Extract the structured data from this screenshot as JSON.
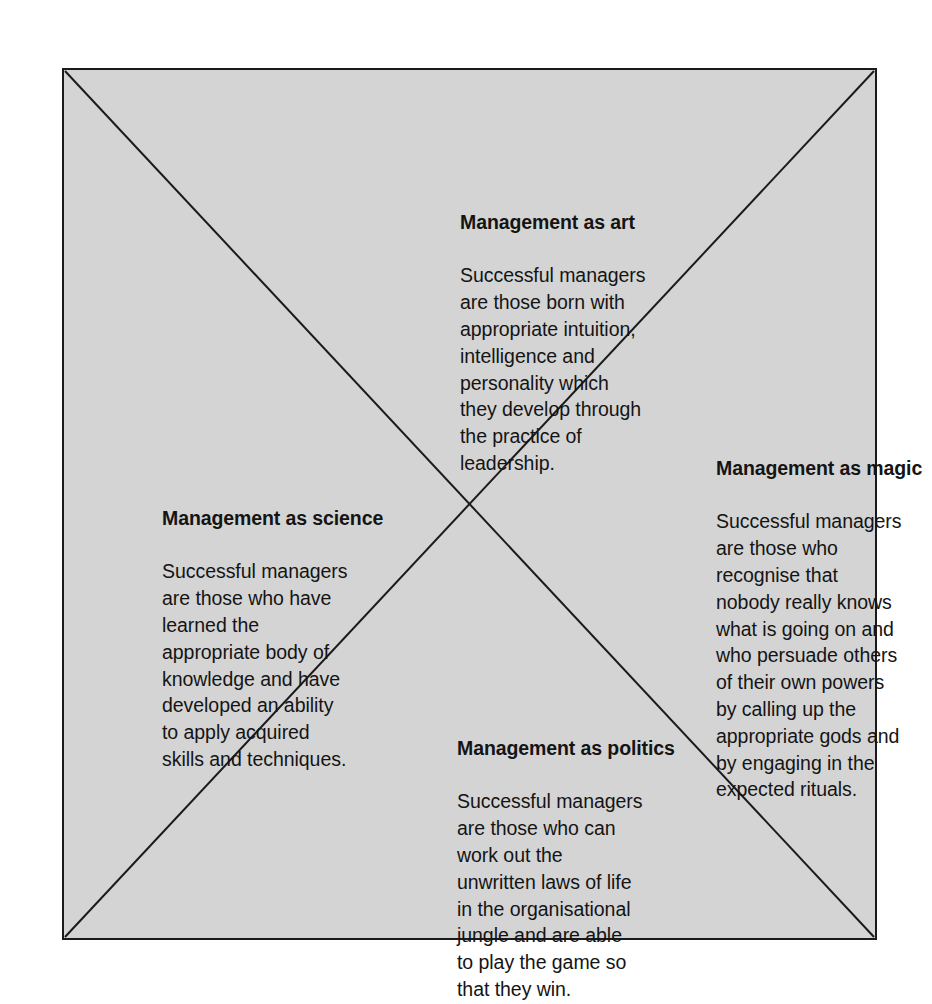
{
  "diagram": {
    "type": "four-quadrant-x-diagram",
    "background_color": "#d4d4d4",
    "border_color": "#1a1a1a",
    "page_background": "#ffffff",
    "text_color": "#141414",
    "quadrants": [
      {
        "id": "art",
        "position": "top",
        "title": "Management as art",
        "body": "Successful managers\nare those born with\nappropriate intuition,\nintelligence and\npersonality which\nthey develop through\nthe practice of\nleadership."
      },
      {
        "id": "magic",
        "position": "right",
        "title": "Management as magic",
        "body": "Successful managers\nare those who\nrecognise that\nnobody really knows\nwhat is going on and\nwho persuade others\nof their own powers\nby calling up the\nappropriate gods and\nby engaging in the\nexpected rituals."
      },
      {
        "id": "science",
        "position": "left",
        "title": "Management as science",
        "body": "Successful managers\nare those who have\nlearned the\nappropriate body of\nknowledge and have\ndeveloped an ability\nto apply acquired\nskills and techniques."
      },
      {
        "id": "politics",
        "position": "bottom",
        "title": "Management as politics",
        "body": "Successful managers\nare those who can\nwork out the\nunwritten laws of life\nin the organisational\njungle and are able\nto play the game so\nthat they win."
      }
    ]
  }
}
